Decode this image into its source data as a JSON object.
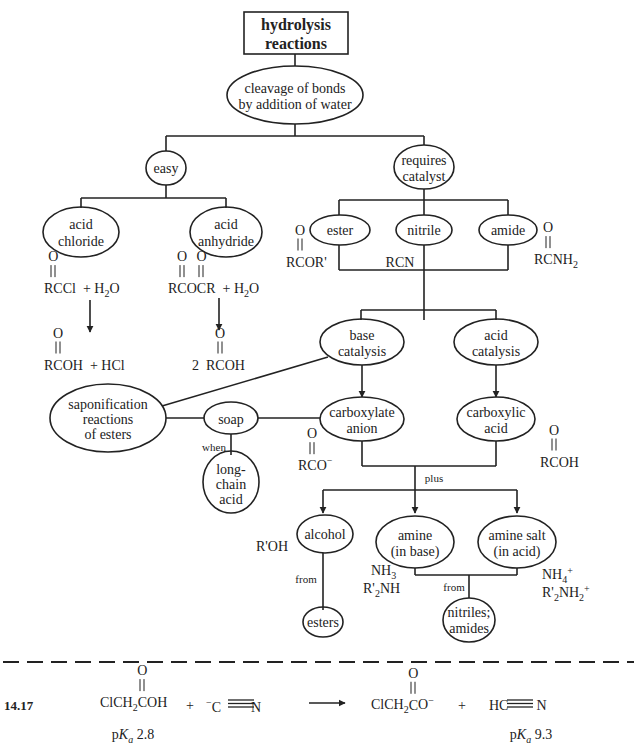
{
  "title": "hydrolysis reactions",
  "title_lines": [
    "hydrolysis",
    "reactions"
  ],
  "nodes": {
    "cleavage": [
      "cleavage of bonds",
      "by addition of water"
    ],
    "easy": "easy",
    "requires_catalyst": [
      "requires",
      "catalyst"
    ],
    "acid_chloride": [
      "acid",
      "chloride"
    ],
    "acid_anhydride": [
      "acid",
      "anhydride"
    ],
    "ester": "ester",
    "nitrile": "nitrile",
    "amide": "amide",
    "base_catalysis": [
      "base",
      "catalysis"
    ],
    "acid_catalysis": [
      "acid",
      "catalysis"
    ],
    "saponification": [
      "saponification",
      "reactions",
      "of esters"
    ],
    "soap": "soap",
    "long_chain_acid": [
      "long-",
      "chain",
      "acid"
    ],
    "carboxylate_anion": [
      "carboxylate",
      "anion"
    ],
    "carboxylic_acid": [
      "carboxylic",
      "acid"
    ],
    "alcohol": "alcohol",
    "amine_base": [
      "amine",
      "(in base)"
    ],
    "amine_salt": [
      "amine salt",
      "(in acid)"
    ],
    "esters": "esters",
    "nitriles_amides": [
      "nitriles;",
      "amides"
    ]
  },
  "edge_labels": {
    "when": "when",
    "plus": "plus",
    "from_alcohol": "from",
    "from_amine": "from"
  },
  "formulas": {
    "rccl": "RCCl",
    "plus_h2o_1": "+ H",
    "h2o_sub": "2",
    "h2o_o": "O",
    "rcocr": "RCOCR",
    "rcor_prime": "RCOR'",
    "rcn": "RCN",
    "rcnh2": "RCNH",
    "rcnh2_sub": "2",
    "rcoh_hcl": "RCOH",
    "plus_hcl": "+ HCl",
    "two_rcoh": "2 RCOH",
    "rco_minus": "RCO",
    "rcoh": "RCOH",
    "roh": "R'OH",
    "nh3": "NH",
    "nh3_sub": "3",
    "r2nh": "R'",
    "r2nh_sub": "2",
    "r2nh_tail": "NH",
    "nh4": "NH",
    "nh4_sub": "4",
    "nh4_sup": "+",
    "r2nh2": "R'",
    "r2nh2_sub": "2",
    "r2nh2_mid": "NH",
    "r2nh2_sub2": "2",
    "r2nh2_sup": "+",
    "carbonyl_o": "O"
  },
  "problem": {
    "number": "14.17",
    "reactant1": "ClCH",
    "reactant1_sub": "2",
    "reactant1_tail": "COH",
    "plus1": "+",
    "reactant2_charge": "−",
    "reactant2_c": "C",
    "reactant2_n": "N",
    "product1": "ClCH",
    "product1_sub": "2",
    "product1_tail": "CO",
    "product1_charge": "−",
    "plus2": "+",
    "product2_h": "HC",
    "product2_n": "N",
    "pka1_label": "p",
    "pka1_k": "K",
    "pka1_a": "a",
    "pka1_value": "2.8",
    "pka2_label": "p",
    "pka2_k": "K",
    "pka2_a": "a",
    "pka2_value": "9.3"
  }
}
